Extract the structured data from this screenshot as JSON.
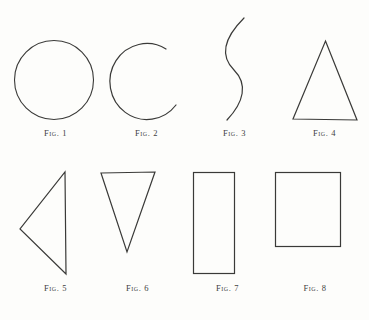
{
  "plate": {
    "title": "Geometric figures plate",
    "background_color": "#fdfdfb",
    "ink_color": "#3a3a38",
    "width": 369,
    "height": 320,
    "rows": 2,
    "columns": 4
  },
  "figures": [
    {
      "id": "fig-1",
      "caption": "Fig. 1",
      "shape": "circle",
      "shape_label": "circle",
      "row": 1,
      "column": 1
    },
    {
      "id": "fig-2",
      "caption": "Fig. 2",
      "shape": "open-arc",
      "shape_label": "incomplete circle arc, open on the right",
      "row": 1,
      "column": 2
    },
    {
      "id": "fig-3",
      "caption": "Fig. 3",
      "shape": "s-curve",
      "shape_label": "sinuous S-shaped curve",
      "row": 1,
      "column": 3
    },
    {
      "id": "fig-4",
      "caption": "Fig. 4",
      "shape": "triangle-up",
      "shape_label": "upward pointing isosceles triangle",
      "row": 1,
      "column": 4
    },
    {
      "id": "fig-5",
      "caption": "Fig. 5",
      "shape": "triangle-left",
      "shape_label": "left pointing triangle",
      "row": 2,
      "column": 1
    },
    {
      "id": "fig-6",
      "caption": "Fig. 6",
      "shape": "triangle-down",
      "shape_label": "downward pointing triangle",
      "row": 2,
      "column": 2
    },
    {
      "id": "fig-7",
      "caption": "Fig. 7",
      "shape": "rectangle-tall",
      "shape_label": "tall vertical rectangle",
      "row": 2,
      "column": 3
    },
    {
      "id": "fig-8",
      "caption": "Fig. 8",
      "shape": "square",
      "shape_label": "square",
      "row": 2,
      "column": 4
    }
  ]
}
